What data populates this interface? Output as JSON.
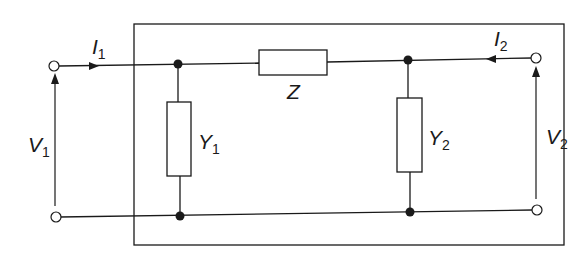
{
  "diagram": {
    "type": "pi-network two-port circuit",
    "labels": {
      "I1": {
        "main": "I",
        "sub": "1"
      },
      "I2": {
        "main": "I",
        "sub": "2"
      },
      "V1": {
        "main": "V",
        "sub": "1"
      },
      "V2": {
        "main": "V",
        "sub": "2"
      },
      "Z": {
        "main": "Z",
        "sub": ""
      },
      "Y1": {
        "main": "Y",
        "sub": "1"
      },
      "Y2": {
        "main": "Y",
        "sub": "2"
      }
    },
    "colors": {
      "line": "#1a1a1a",
      "background": "#ffffff"
    }
  }
}
